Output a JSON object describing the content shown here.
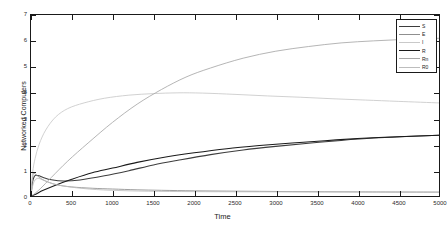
{
  "chart_data": {
    "type": "line",
    "title": "",
    "xlabel": "Time",
    "ylabel": "Networked Computers",
    "xlim": [
      0,
      5000
    ],
    "ylim": [
      0,
      7
    ],
    "xticks": [
      0,
      500,
      1000,
      1500,
      2000,
      2500,
      3000,
      3500,
      4000,
      4500,
      5000
    ],
    "yticks": [
      0,
      1,
      2,
      3,
      4,
      5,
      6,
      7
    ],
    "grid": false,
    "legend_position": "top-right",
    "series": [
      {
        "name": "S",
        "color": "#3d3d3d",
        "x": [
          0,
          20,
          40,
          60,
          100,
          150,
          250,
          400,
          600,
          900,
          1200,
          1500,
          1800,
          2200,
          2600,
          3000,
          3400,
          3800,
          4200,
          4600,
          5000
        ],
        "y": [
          0.05,
          0.55,
          0.75,
          0.8,
          0.78,
          0.72,
          0.63,
          0.58,
          0.62,
          0.78,
          0.98,
          1.2,
          1.38,
          1.6,
          1.78,
          1.92,
          2.04,
          2.15,
          2.24,
          2.3,
          2.35
        ]
      },
      {
        "name": "E",
        "color": "#8f8f8f",
        "x": [
          0,
          15,
          30,
          50,
          80,
          130,
          200,
          320,
          500,
          750,
          1000,
          1300,
          1600,
          2000,
          2400,
          2800,
          3200,
          3600,
          4000,
          4400,
          5000
        ],
        "y": [
          0.02,
          0.6,
          0.88,
          0.85,
          0.78,
          0.66,
          0.55,
          0.43,
          0.35,
          0.3,
          0.27,
          0.24,
          0.22,
          0.2,
          0.19,
          0.18,
          0.17,
          0.165,
          0.16,
          0.155,
          0.15
        ]
      },
      {
        "name": "I",
        "color": "#c9c9c9",
        "x": [
          0,
          20,
          50,
          100,
          180,
          300,
          450,
          650,
          900,
          1200,
          1500,
          1800,
          2100,
          2500,
          2900,
          3300,
          3700,
          4100,
          4500,
          5000
        ],
        "y": [
          0.04,
          0.9,
          1.45,
          2.0,
          2.55,
          3.05,
          3.38,
          3.6,
          3.78,
          3.9,
          3.96,
          3.99,
          3.98,
          3.93,
          3.87,
          3.82,
          3.76,
          3.71,
          3.66,
          3.6
        ]
      },
      {
        "name": "R",
        "color": "#1a1a1a",
        "x": [
          0,
          50,
          150,
          300,
          500,
          750,
          1000,
          1300,
          1600,
          2000,
          2400,
          2800,
          3200,
          3600,
          4000,
          4400,
          5000
        ],
        "y": [
          0.0,
          0.06,
          0.22,
          0.42,
          0.65,
          0.9,
          1.08,
          1.3,
          1.48,
          1.67,
          1.83,
          1.95,
          2.05,
          2.14,
          2.22,
          2.28,
          2.35
        ]
      },
      {
        "name": "Rn",
        "color": "#a8a8a8",
        "x": [
          0,
          40,
          120,
          250,
          450,
          700,
          1000,
          1300,
          1600,
          1900,
          2200,
          2600,
          3000,
          3400,
          3800,
          4200,
          4600,
          5000
        ],
        "y": [
          0.0,
          0.08,
          0.3,
          0.72,
          1.35,
          2.05,
          2.85,
          3.55,
          4.12,
          4.6,
          4.95,
          5.33,
          5.6,
          5.78,
          5.92,
          6.0,
          6.06,
          6.1
        ]
      },
      {
        "name": "R0",
        "color": "#bdbdbd",
        "x": [
          0,
          30,
          80,
          160,
          300,
          500,
          800,
          1200,
          1700,
          2300,
          3000,
          3800,
          4500,
          5000
        ],
        "y": [
          0.02,
          0.5,
          0.68,
          0.6,
          0.45,
          0.34,
          0.25,
          0.2,
          0.175,
          0.165,
          0.16,
          0.155,
          0.152,
          0.15
        ]
      }
    ]
  },
  "legend": {
    "entries": [
      {
        "label": "S"
      },
      {
        "label": "E"
      },
      {
        "label": "I"
      },
      {
        "label": "R"
      },
      {
        "label": "Rn"
      },
      {
        "label": "R0"
      }
    ]
  }
}
